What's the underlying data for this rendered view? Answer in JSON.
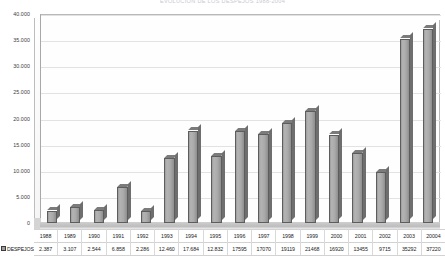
{
  "chart_data": {
    "type": "bar",
    "title": "EVOLUCION DE LOS DESPEJOS 1988-2004",
    "xlabel": "",
    "ylabel": "",
    "ylim": [
      0,
      40000
    ],
    "ytick_labels": [
      "0",
      "5.000",
      "10.000",
      "15.000",
      "20.000",
      "25.000",
      "30.000",
      "35.000",
      "40.000"
    ],
    "ytick_values": [
      0,
      5000,
      10000,
      15000,
      20000,
      25000,
      30000,
      35000,
      40000
    ],
    "grid": true,
    "legend_position": "bottom-left",
    "categories": [
      "1988",
      "1989",
      "1990",
      "1991",
      "1992",
      "1993",
      "1994",
      "1995",
      "1996",
      "1997",
      "1998",
      "1999",
      "2000",
      "2001",
      "2002",
      "2003",
      "20004"
    ],
    "series": [
      {
        "name": "DESPEJOS",
        "color": "#9e9e9e",
        "values": [
          2387,
          3107,
          2544,
          6858,
          2286,
          12460,
          17684,
          12832,
          17595,
          17070,
          19119,
          21468,
          16920,
          13455,
          9715,
          35292,
          37220
        ],
        "value_labels": [
          "2.387",
          "3.107",
          "2.544",
          "6.858",
          "2.286",
          "12.460",
          "17.684",
          "12.832",
          "17595",
          "17070",
          "19119",
          "21468",
          "16920",
          "13455",
          "9715",
          "35292",
          "37220"
        ]
      }
    ]
  },
  "legend": {
    "series_label": "DESPEJOS",
    "swatch_color": "#9e9e9e"
  }
}
